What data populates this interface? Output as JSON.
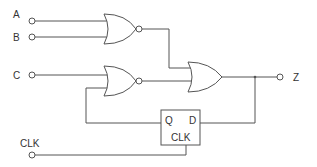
{
  "diagram": {
    "type": "logic-circuit",
    "inputs": [
      {
        "id": "A",
        "label": "A"
      },
      {
        "id": "B",
        "label": "B"
      },
      {
        "id": "C",
        "label": "C"
      },
      {
        "id": "CLK",
        "label": "CLK"
      }
    ],
    "outputs": [
      {
        "id": "Z",
        "label": "Z"
      }
    ],
    "gates": [
      {
        "id": "nor1",
        "type": "NOR",
        "inputs": [
          "A",
          "B"
        ]
      },
      {
        "id": "nor2",
        "type": "NOR",
        "inputs": [
          "C",
          "Q"
        ]
      },
      {
        "id": "or1",
        "type": "OR",
        "inputs": [
          "nor1",
          "nor2"
        ],
        "output": "Z"
      }
    ],
    "flipflop": {
      "type": "D flip-flop",
      "q_label": "Q",
      "d_label": "D",
      "clk_label": "CLK",
      "d_input": "Z",
      "clock": "CLK"
    }
  }
}
